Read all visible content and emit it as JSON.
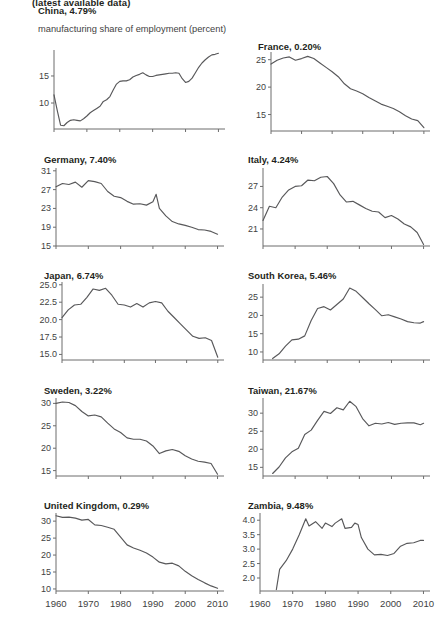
{
  "header": {
    "title": "(latest available data)",
    "subtitle": "manufacturing share of employment (percent)"
  },
  "axis": {
    "x_ticks": [
      "1960",
      "1970",
      "1980",
      "1990",
      "2000",
      "2010"
    ]
  },
  "chart_data": {
    "type": "line",
    "title": "(latest available data)",
    "ylabel": "manufacturing share of employment (percent)",
    "xlabel": "",
    "grid": false,
    "legend": "none",
    "xlim": [
      1960,
      2012
    ],
    "panels": [
      {
        "name": "China",
        "label": "China, 4.79%",
        "value": "4.79%",
        "ylim": [
          5.2,
          19.8
        ],
        "yticks": [
          10,
          15
        ],
        "ytick_labels": [
          "10",
          "15"
        ],
        "x": [
          1960,
          1961,
          1962,
          1963,
          1964,
          1965,
          1966,
          1967,
          1968,
          1969,
          1970,
          1971,
          1972,
          1973,
          1974,
          1975,
          1976,
          1977,
          1978,
          1979,
          1980,
          1981,
          1982,
          1983,
          1984,
          1985,
          1986,
          1987,
          1988,
          1989,
          1990,
          1991,
          1992,
          1993,
          1994,
          1995,
          1996,
          1997,
          1998,
          1999,
          2000,
          2001,
          2002,
          2003,
          2004,
          2005,
          2006,
          2007,
          2008,
          2009,
          2010
        ],
        "y": [
          11.5,
          8.6,
          5.9,
          5.8,
          6.4,
          6.8,
          6.9,
          6.8,
          6.7,
          7.1,
          7.6,
          8.2,
          8.6,
          9.0,
          9.4,
          10.3,
          10.6,
          11.2,
          12.4,
          13.5,
          14.0,
          14.1,
          14.1,
          14.3,
          14.8,
          15.1,
          15.3,
          15.6,
          15.2,
          14.9,
          14.9,
          15.1,
          15.2,
          15.3,
          15.4,
          15.5,
          15.5,
          15.6,
          15.5,
          14.5,
          13.8,
          14.0,
          14.6,
          15.6,
          16.6,
          17.4,
          18.0,
          18.5,
          18.9,
          19.0,
          19.2
        ]
      },
      {
        "name": "France",
        "label": "France, 0.20%",
        "value": "0.20%",
        "ylim": [
          12.0,
          26.4
        ],
        "yticks": [
          15,
          20,
          25
        ],
        "ytick_labels": [
          "15",
          "20",
          "25"
        ],
        "x": [
          1960,
          1962,
          1964,
          1966,
          1968,
          1970,
          1972,
          1974,
          1976,
          1978,
          1980,
          1982,
          1984,
          1986,
          1988,
          1990,
          1992,
          1994,
          1996,
          1998,
          2000,
          2002,
          2004,
          2006,
          2008,
          2010
        ],
        "y": [
          24.2,
          24.9,
          25.3,
          25.5,
          24.9,
          25.2,
          25.6,
          25.2,
          24.4,
          23.6,
          22.8,
          21.9,
          20.6,
          19.7,
          19.3,
          18.8,
          18.1,
          17.5,
          16.9,
          16.5,
          16.1,
          15.5,
          14.8,
          14.2,
          13.9,
          12.6
        ]
      },
      {
        "name": "Germany",
        "label": "Germany, 7.40%",
        "value": "7.40%",
        "ylim": [
          15.0,
          31.6
        ],
        "yticks": [
          15,
          19,
          23,
          27,
          31
        ],
        "ytick_labels": [
          "15",
          "19",
          "23",
          "27",
          "31"
        ],
        "x": [
          1960,
          1962,
          1964,
          1966,
          1968,
          1970,
          1972,
          1974,
          1976,
          1978,
          1980,
          1982,
          1984,
          1986,
          1988,
          1990,
          1991,
          1992,
          1994,
          1996,
          1998,
          2000,
          2002,
          2004,
          2006,
          2008,
          2010
        ],
        "y": [
          27.6,
          28.3,
          28.1,
          28.6,
          27.5,
          28.9,
          28.7,
          28.3,
          26.6,
          25.6,
          25.3,
          24.5,
          23.9,
          24.0,
          23.7,
          24.4,
          26.0,
          23.0,
          21.4,
          20.2,
          19.7,
          19.4,
          19.0,
          18.5,
          18.4,
          18.1,
          17.5
        ]
      },
      {
        "name": "Italy",
        "label": "Italy, 4.24%",
        "value": "4.24%",
        "ylim": [
          18.6,
          29.6
        ],
        "yticks": [
          21,
          24,
          27
        ],
        "ytick_labels": [
          "21",
          "24",
          "27"
        ],
        "x": [
          1960,
          1962,
          1964,
          1966,
          1968,
          1970,
          1972,
          1974,
          1976,
          1978,
          1980,
          1982,
          1984,
          1986,
          1988,
          1990,
          1992,
          1994,
          1996,
          1998,
          2000,
          2002,
          2004,
          2006,
          2008,
          2010
        ],
        "y": [
          22.2,
          24.2,
          24.0,
          25.5,
          26.5,
          27.0,
          27.1,
          27.9,
          27.8,
          28.3,
          28.4,
          27.4,
          25.8,
          24.8,
          24.9,
          24.4,
          23.9,
          23.5,
          23.4,
          22.6,
          22.9,
          22.4,
          21.7,
          21.3,
          20.5,
          18.8
        ]
      },
      {
        "name": "Japan",
        "label": "Japan, 6.74%",
        "value": "6.74%",
        "ylim": [
          14.2,
          25.4
        ],
        "yticks": [
          15.0,
          17.5,
          20.0,
          22.5,
          25.0
        ],
        "ytick_labels": [
          "15.0",
          "17.5",
          "20.0",
          "22.5",
          "25.0"
        ],
        "x": [
          1960,
          1962,
          1964,
          1966,
          1968,
          1970,
          1972,
          1974,
          1976,
          1978,
          1980,
          1982,
          1984,
          1986,
          1988,
          1990,
          1992,
          1994,
          1996,
          1998,
          2000,
          2002,
          2004,
          2006,
          2008,
          2010
        ],
        "y": [
          20.3,
          21.4,
          22.1,
          22.2,
          23.2,
          24.4,
          24.2,
          24.5,
          23.5,
          22.2,
          22.1,
          21.8,
          22.3,
          21.8,
          22.4,
          22.6,
          22.4,
          21.2,
          20.3,
          19.4,
          18.5,
          17.6,
          17.3,
          17.4,
          17.0,
          14.6
        ]
      },
      {
        "name": "South Korea",
        "label": "South Korea, 5.46%",
        "value": "5.46%",
        "ylim": [
          7.8,
          28.6
        ],
        "yticks": [
          10,
          15,
          20,
          25
        ],
        "ytick_labels": [
          "10",
          "15",
          "20",
          "25"
        ],
        "x": [
          1963,
          1965,
          1967,
          1969,
          1971,
          1973,
          1975,
          1977,
          1979,
          1981,
          1983,
          1985,
          1987,
          1989,
          1991,
          1993,
          1995,
          1997,
          1999,
          2001,
          2003,
          2005,
          2007,
          2009,
          2010
        ],
        "y": [
          8.2,
          9.5,
          11.6,
          13.3,
          13.5,
          14.4,
          18.6,
          21.9,
          22.4,
          21.5,
          23.0,
          24.5,
          27.5,
          26.6,
          24.9,
          23.2,
          21.6,
          19.9,
          20.2,
          19.6,
          19.0,
          18.3,
          18.0,
          17.9,
          18.3
        ]
      },
      {
        "name": "Sweden",
        "label": "Sweden, 3.22%",
        "value": "3.22%",
        "ylim": [
          13.8,
          31.2
        ],
        "yticks": [
          15,
          20,
          25,
          30
        ],
        "ytick_labels": [
          "15",
          "20",
          "25",
          "30"
        ],
        "x": [
          1960,
          1962,
          1964,
          1966,
          1968,
          1970,
          1972,
          1974,
          1976,
          1978,
          1980,
          1982,
          1984,
          1986,
          1988,
          1990,
          1992,
          1994,
          1996,
          1998,
          2000,
          2002,
          2004,
          2006,
          2008,
          2010
        ],
        "y": [
          30.0,
          30.3,
          30.2,
          29.5,
          28.2,
          27.2,
          27.4,
          27.0,
          25.6,
          24.3,
          23.5,
          22.3,
          22.0,
          22.0,
          21.6,
          20.5,
          18.8,
          19.4,
          19.7,
          19.3,
          18.3,
          17.6,
          17.1,
          16.9,
          16.6,
          14.2
        ]
      },
      {
        "name": "Taiwan",
        "label": "Taiwan, 21.67%",
        "value": "21.67%",
        "ylim": [
          12.6,
          34.2
        ],
        "yticks": [
          15,
          20,
          25,
          30
        ],
        "ytick_labels": [
          "15",
          "20",
          "25",
          "30"
        ],
        "x": [
          1963,
          1965,
          1967,
          1969,
          1971,
          1973,
          1975,
          1977,
          1979,
          1981,
          1983,
          1985,
          1987,
          1989,
          1991,
          1993,
          1995,
          1997,
          1999,
          2001,
          2003,
          2005,
          2007,
          2009,
          2010
        ],
        "y": [
          13.3,
          15.1,
          17.6,
          19.3,
          20.3,
          24.1,
          25.3,
          28.0,
          30.5,
          29.9,
          31.5,
          30.9,
          33.3,
          31.8,
          28.5,
          26.5,
          27.2,
          27.0,
          27.4,
          26.9,
          27.2,
          27.3,
          27.3,
          26.8,
          27.2
        ]
      },
      {
        "name": "United Kingdom",
        "label": "United Kingdom, 0.29%",
        "value": "0.29%",
        "ylim": [
          9.4,
          32.4
        ],
        "yticks": [
          10,
          15,
          20,
          25,
          30
        ],
        "ytick_labels": [
          "10",
          "15",
          "20",
          "25",
          "30"
        ],
        "x": [
          1960,
          1962,
          1964,
          1966,
          1968,
          1970,
          1972,
          1974,
          1976,
          1978,
          1980,
          1982,
          1984,
          1986,
          1988,
          1990,
          1992,
          1994,
          1996,
          1998,
          2000,
          2002,
          2004,
          2006,
          2008,
          2010
        ],
        "y": [
          31.6,
          31.1,
          31.2,
          30.9,
          30.3,
          30.5,
          28.9,
          28.7,
          28.2,
          27.6,
          25.3,
          23.0,
          22.1,
          21.4,
          20.6,
          19.4,
          17.9,
          17.4,
          17.6,
          16.8,
          15.2,
          13.9,
          12.8,
          11.8,
          10.9,
          10.2
        ]
      },
      {
        "name": "Zambia",
        "label": "Zambia, 9.48%",
        "value": "9.48%",
        "ylim": [
          1.55,
          4.25
        ],
        "yticks": [
          2.0,
          2.5,
          3.0,
          3.5,
          4.0
        ],
        "ytick_labels": [
          "2.0",
          "2.5",
          "3.0",
          "3.5",
          "4.0"
        ],
        "x": [
          1965,
          1966,
          1968,
          1970,
          1972,
          1974,
          1975,
          1977,
          1979,
          1980,
          1982,
          1983,
          1985,
          1986,
          1988,
          1989,
          1990,
          1991,
          1993,
          1995,
          1997,
          1999,
          2001,
          2003,
          2005,
          2007,
          2009,
          2010
        ],
        "y": [
          1.6,
          2.3,
          2.6,
          3.0,
          3.5,
          4.05,
          3.8,
          3.95,
          3.72,
          3.9,
          3.78,
          3.9,
          4.05,
          3.72,
          3.75,
          3.9,
          3.85,
          3.4,
          3.0,
          2.8,
          2.82,
          2.78,
          2.85,
          3.1,
          3.2,
          3.22,
          3.3,
          3.3
        ]
      }
    ]
  }
}
